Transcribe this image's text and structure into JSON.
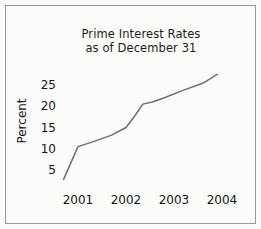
{
  "chart_data": {
    "type": "line",
    "title": "Prime Interest Rates as of December 31",
    "title_lines": [
      "Prime Interest Rates",
      "as of December 31"
    ],
    "xlabel": "",
    "ylabel": "Percent",
    "grid": false,
    "legend": "none",
    "xlim": [
      2000.6,
      2004.3
    ],
    "ylim": [
      0,
      28
    ],
    "xticks": [
      "2001",
      "2002",
      "2003",
      "2004"
    ],
    "xtick_values": [
      2001,
      2002,
      2003,
      2004
    ],
    "yticks": [
      "5",
      "10",
      "15",
      "20",
      "25"
    ],
    "ytick_values": [
      5,
      10,
      15,
      20,
      25
    ],
    "series": [
      {
        "name": "Prime Interest Rate",
        "color": "#6e6e6e",
        "x": [
          2000.7,
          2001.0,
          2001.35,
          2001.7,
          2002.0,
          2002.2,
          2002.35,
          2002.55,
          2002.8,
          2003.2,
          2003.6,
          2003.9
        ],
        "values": [
          2.8,
          10.5,
          11.8,
          13.2,
          15.0,
          18.0,
          20.5,
          21.0,
          22.0,
          23.8,
          25.4,
          27.5
        ]
      }
    ]
  },
  "axes": {
    "ytick_pixels": [
      170,
      149,
      128,
      106,
      85
    ],
    "xtick_pixels": [
      78,
      126,
      174,
      222
    ]
  }
}
